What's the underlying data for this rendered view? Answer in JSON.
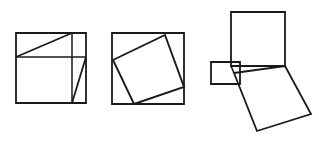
{
  "document": {
    "title": "Geometric Figures — Dissection Proof Illustrations",
    "background_color": "#ffffff",
    "stroke_color": "#1a1a1a",
    "canvas": {
      "width": 319,
      "height": 141
    }
  },
  "figures": [
    {
      "id": "figure-1",
      "name": "subdivided-square",
      "caption": "",
      "description": "Square subdivided by one horizontal chord, one vertical chord and two diagonals",
      "stroke_width": 1.6,
      "shapes": [
        {
          "name": "outer-square",
          "type": "polygon",
          "points": "16,33 86,33 86,103 16,103",
          "closed": true,
          "stroke_width": 1.8
        },
        {
          "name": "horizontal-chord",
          "type": "polyline",
          "points": "16,57 86,57",
          "closed": false,
          "stroke_width": 1.5
        },
        {
          "name": "vertical-chord",
          "type": "polyline",
          "points": "72,33 72,103",
          "closed": false,
          "stroke_width": 1.5
        },
        {
          "name": "upper-diagonal",
          "type": "polyline",
          "points": "16,57 72,33",
          "closed": false,
          "stroke_width": 1.8
        },
        {
          "name": "lower-diagonal",
          "type": "polyline",
          "points": "86,57 72,103",
          "closed": false,
          "stroke_width": 1.8
        }
      ]
    },
    {
      "id": "figure-2",
      "name": "inscribed-tilted-square",
      "caption": "",
      "description": "Outer axis-aligned square containing an inscribed tilted square touching each side",
      "stroke_width": 1.6,
      "shapes": [
        {
          "name": "outer-square",
          "type": "polygon",
          "points": "112,33 184,33 184,104 112,104",
          "closed": true,
          "stroke_width": 1.8
        },
        {
          "name": "inner-tilted-square",
          "type": "polygon",
          "points": "113,60 165,35 184,87 134,104",
          "closed": true,
          "stroke_width": 1.9
        }
      ]
    },
    {
      "id": "figure-3",
      "name": "pythagorean-squares-arrangement",
      "caption": "",
      "description": "Three squares arranged about a right triangle: tall upper square, small left rectangle and large tilted lower square",
      "stroke_width": 1.6,
      "shapes": [
        {
          "name": "upper-square",
          "type": "polygon",
          "points": "231,12 285,12 285,66 231,66",
          "closed": true,
          "stroke_width": 1.8
        },
        {
          "name": "left-rectangle",
          "type": "polygon",
          "points": "211,62 240,62 240,84 211,84",
          "closed": true,
          "stroke_width": 1.8
        },
        {
          "name": "lower-tilted-square",
          "type": "polygon",
          "points": "234,73 285,66 311,114 257,131",
          "closed": true,
          "stroke_width": 1.8
        },
        {
          "name": "hypotenuse-line",
          "type": "polyline",
          "points": "231,66 285,66",
          "closed": false,
          "stroke_width": 1.6
        },
        {
          "name": "triangle-leg-line",
          "type": "polyline",
          "points": "234,73 231,66",
          "closed": false,
          "stroke_width": 1.6
        }
      ]
    }
  ]
}
